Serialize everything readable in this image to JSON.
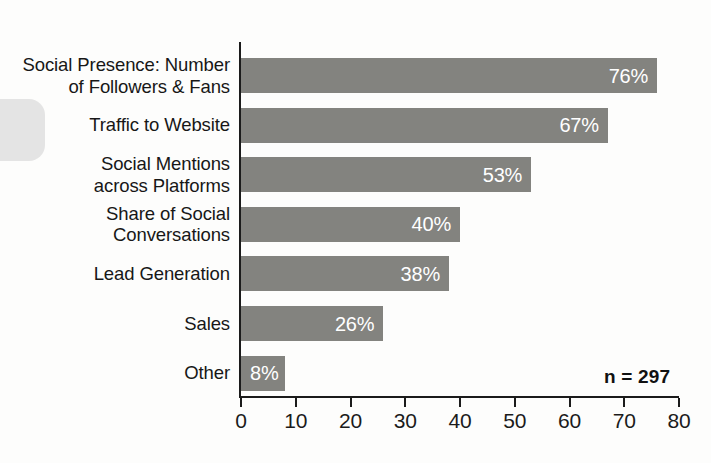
{
  "chart_data": {
    "type": "bar",
    "orientation": "horizontal",
    "title": "",
    "subtitle": "",
    "xlabel": "",
    "ylabel": "",
    "xlim": [
      0,
      80
    ],
    "xticks": [
      0,
      10,
      20,
      30,
      40,
      50,
      60,
      70,
      80
    ],
    "grid": false,
    "legend": null,
    "value_suffix": "%",
    "categories": [
      "Social Presence: Number\nof Followers & Fans",
      "Traffic to Website",
      "Social Mentions\nacross Platforms",
      "Share of Social\nConversations",
      "Lead Generation",
      "Sales",
      "Other"
    ],
    "values": [
      76,
      67,
      53,
      40,
      38,
      26,
      8
    ],
    "value_labels": [
      "76%",
      "67%",
      "53%",
      "40%",
      "38%",
      "26%",
      "8%"
    ],
    "annotations": [
      {
        "name": "sample-size",
        "text": "n = 297"
      }
    ],
    "colors": {
      "bar_fill": "#83837f",
      "value_label": "#ffffff",
      "axis": "#1b1b1b",
      "category_label": "#171717",
      "background": "#fdfdfc"
    }
  },
  "axis": {
    "tick_labels": [
      "0",
      "10",
      "20",
      "30",
      "40",
      "50",
      "60",
      "70",
      "80"
    ]
  },
  "bars": [
    {
      "label": "Social Presence: Number\nof Followers & Fans",
      "value_label": "76%",
      "value": 76,
      "label_inside_align": "end"
    },
    {
      "label": "Traffic to Website",
      "value_label": "67%",
      "value": 67,
      "label_inside_align": "end"
    },
    {
      "label": "Social Mentions\nacross Platforms",
      "value_label": "53%",
      "value": 53,
      "label_inside_align": "end"
    },
    {
      "label": "Share of Social\nConversations",
      "value_label": "40%",
      "value": 40,
      "label_inside_align": "end"
    },
    {
      "label": "Lead Generation",
      "value_label": "38%",
      "value": 38,
      "label_inside_align": "end"
    },
    {
      "label": "Sales",
      "value_label": "26%",
      "value": 26,
      "label_inside_align": "end"
    },
    {
      "label": "Other",
      "value_label": "8%",
      "value": 8,
      "label_inside_align": "start"
    }
  ],
  "note": {
    "sample_size": "n = 297"
  }
}
